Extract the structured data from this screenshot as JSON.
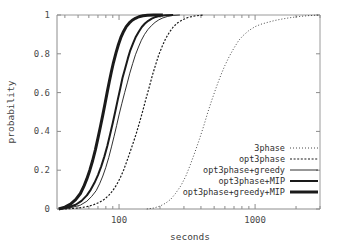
{
  "chart_data": {
    "type": "line",
    "title": "",
    "xlabel": "seconds",
    "ylabel": "probability",
    "xscale": "log",
    "yscale": "linear",
    "xlim": [
      35,
      3000
    ],
    "ylim": [
      0,
      1
    ],
    "grid": false,
    "legend_position": "bottom-right",
    "xticks": [
      100,
      1000
    ],
    "xticklabels": [
      "100",
      "1000"
    ],
    "yticks": [
      0,
      0.2,
      0.4,
      0.6,
      0.8,
      1
    ],
    "yticklabels": [
      "0",
      "0.2",
      "0.4",
      "0.6",
      "0.8",
      "1"
    ],
    "series": [
      {
        "name": "3phase",
        "style": "fine-dotted",
        "width": 0.8,
        "x": [
          160,
          180,
          200,
          220,
          240,
          260,
          285,
          310,
          335,
          360,
          390,
          420,
          450,
          480,
          520,
          560,
          600,
          650,
          700,
          760,
          820,
          900,
          1000,
          1100,
          1250,
          1400,
          1600,
          1800,
          2100,
          2500,
          3000
        ],
        "y": [
          0.0,
          0.005,
          0.015,
          0.03,
          0.05,
          0.08,
          0.12,
          0.17,
          0.23,
          0.29,
          0.36,
          0.43,
          0.5,
          0.56,
          0.63,
          0.69,
          0.74,
          0.79,
          0.83,
          0.87,
          0.895,
          0.92,
          0.94,
          0.952,
          0.963,
          0.972,
          0.98,
          0.986,
          0.992,
          0.997,
          1.0
        ]
      },
      {
        "name": "opt3phase",
        "style": "coarse-dotted",
        "width": 1.2,
        "x": [
          40,
          50,
          58,
          65,
          72,
          78,
          84,
          90,
          96,
          102,
          108,
          114,
          120,
          127,
          134,
          142,
          150,
          158,
          167,
          176,
          186,
          196,
          208,
          220,
          235,
          250,
          270,
          295,
          320,
          360,
          420
        ],
        "y": [
          0.0,
          0.005,
          0.012,
          0.022,
          0.035,
          0.05,
          0.07,
          0.095,
          0.125,
          0.16,
          0.2,
          0.245,
          0.29,
          0.34,
          0.39,
          0.45,
          0.51,
          0.57,
          0.63,
          0.69,
          0.745,
          0.795,
          0.84,
          0.878,
          0.912,
          0.938,
          0.96,
          0.976,
          0.987,
          0.995,
          1.0
        ]
      },
      {
        "name": "opt3phase+greedy",
        "style": "thin-solid",
        "width": 0.9,
        "x": [
          38,
          45,
          52,
          58,
          63,
          68,
          72,
          76,
          80,
          84,
          88,
          92,
          96,
          100,
          105,
          110,
          115,
          120,
          126,
          132,
          139,
          146,
          154,
          163,
          173,
          184,
          196,
          210,
          228,
          250,
          280
        ],
        "y": [
          0.0,
          0.008,
          0.02,
          0.04,
          0.065,
          0.095,
          0.13,
          0.17,
          0.215,
          0.265,
          0.32,
          0.375,
          0.43,
          0.485,
          0.545,
          0.6,
          0.65,
          0.7,
          0.75,
          0.795,
          0.835,
          0.87,
          0.9,
          0.925,
          0.945,
          0.962,
          0.975,
          0.985,
          0.993,
          0.998,
          1.0
        ]
      },
      {
        "name": "opt3phase+MIP",
        "style": "medium-solid",
        "width": 2.0,
        "x": [
          37,
          42,
          48,
          53,
          58,
          62,
          66,
          70,
          74,
          78,
          82,
          86,
          90,
          94,
          98,
          102,
          106,
          111,
          116,
          121,
          127,
          133,
          140,
          147,
          155,
          164,
          174,
          186,
          200,
          220,
          250
        ],
        "y": [
          0.0,
          0.008,
          0.022,
          0.042,
          0.07,
          0.1,
          0.135,
          0.175,
          0.22,
          0.27,
          0.325,
          0.385,
          0.445,
          0.505,
          0.565,
          0.62,
          0.675,
          0.725,
          0.775,
          0.818,
          0.855,
          0.888,
          0.915,
          0.938,
          0.956,
          0.97,
          0.981,
          0.99,
          0.996,
          0.999,
          1.0
        ]
      },
      {
        "name": "opt3phase+greedy+MIP",
        "style": "thick-solid",
        "width": 3.0,
        "x": [
          36,
          40,
          44,
          48,
          52,
          55,
          58,
          61,
          64,
          67,
          70,
          73,
          76,
          79,
          82,
          85,
          88,
          91,
          95,
          99,
          103,
          108,
          113,
          119,
          125,
          132,
          140,
          150,
          162,
          180,
          210
        ],
        "y": [
          0.0,
          0.01,
          0.025,
          0.048,
          0.08,
          0.115,
          0.155,
          0.2,
          0.25,
          0.305,
          0.365,
          0.425,
          0.485,
          0.545,
          0.605,
          0.66,
          0.71,
          0.755,
          0.805,
          0.848,
          0.883,
          0.915,
          0.94,
          0.959,
          0.973,
          0.983,
          0.991,
          0.996,
          0.999,
          1.0,
          1.0
        ]
      }
    ],
    "legend": [
      {
        "label": "3phase",
        "style": "fine-dotted"
      },
      {
        "label": "opt3phase",
        "style": "coarse-dotted"
      },
      {
        "label": "opt3phase+greedy",
        "style": "thin-solid"
      },
      {
        "label": "opt3phase+MIP",
        "style": "medium-solid"
      },
      {
        "label": "opt3phase+greedy+MIP",
        "style": "thick-solid"
      }
    ]
  }
}
